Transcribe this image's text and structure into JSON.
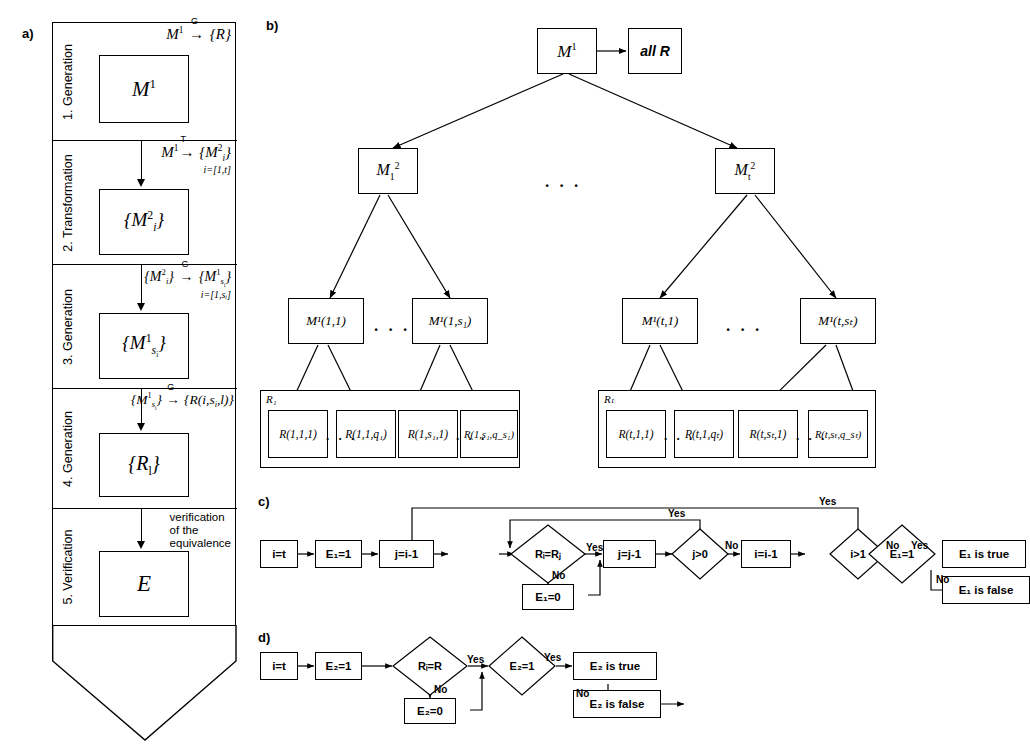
{
  "figure": {
    "panels": [
      {
        "id": "a",
        "label": "a)"
      },
      {
        "id": "b",
        "label": "b)"
      },
      {
        "id": "c",
        "label": "c)"
      },
      {
        "id": "d",
        "label": "d)"
      }
    ]
  },
  "panel_a": {
    "label": "a)",
    "stages": [
      {
        "index": "1. Generation",
        "formula_main": "M¹",
        "formula_arrow": "G",
        "formula_rhs": "{R}",
        "sub": "",
        "box": "M¹"
      },
      {
        "index": "2. Transformation",
        "formula_main": "M¹",
        "formula_arrow": "T",
        "formula_rhs": "{M²ᵢ}",
        "sub": "i=[1,t]",
        "box": "{M²ᵢ}"
      },
      {
        "index": "3. Generation",
        "formula_main": "{M²ᵢ}",
        "formula_arrow": "G",
        "formula_rhs": "{M¹ₛᵢ}",
        "sub": "i=[1,sᵢ]",
        "box": "{M¹ₛᵢ}"
      },
      {
        "index": "4. Generation",
        "formula_main": "{M¹ₛᵢ}",
        "formula_arrow": "G",
        "formula_rhs": "{R(i,sᵢ,l)}",
        "sub": "",
        "box": "{Rᵢ}"
      },
      {
        "index": "5. Verification",
        "formula_main": "",
        "formula_arrow": "",
        "formula_rhs": "",
        "sub": "",
        "box": "E",
        "note": "verification\nof the\nequivalence"
      }
    ],
    "note_lines": [
      "verification",
      "of the",
      "equivalence"
    ]
  },
  "panel_b": {
    "label": "b)",
    "root": "M¹",
    "all_r": "all R",
    "level2": [
      {
        "text_base": "M",
        "sub": "1",
        "sup": "2"
      },
      {
        "text_base": "M",
        "sub": "t",
        "sup": "2"
      }
    ],
    "level2_ellipsis": ". . .",
    "level3": [
      {
        "text": "M¹(1,1)"
      },
      {
        "text": "M¹(1,s₁)"
      },
      {
        "text": "M¹(t,1)"
      },
      {
        "text": "M¹(t,sₜ)"
      }
    ],
    "level3_ellipsis": ". . .",
    "groups": [
      {
        "label": "R₁",
        "boxes": [
          {
            "text": "R(1,1,1)"
          },
          {
            "text": "R(1,1,q₁)"
          },
          {
            "text": "R(1,s₁,1)"
          },
          {
            "text": "R(1,s₁,q_s₁)"
          }
        ],
        "ellipsis": ". . ."
      },
      {
        "label": "Rₜ",
        "boxes": [
          {
            "text": "R(t,1,1)"
          },
          {
            "text": "R(t,1,qₜ)"
          },
          {
            "text": "R(t,sₜ,1)"
          },
          {
            "text": "R(t,sₜ,q_sₜ)"
          }
        ],
        "ellipsis": ". . ."
      }
    ]
  },
  "panel_c": {
    "label": "c)",
    "nodes": [
      {
        "id": "start",
        "kind": "box",
        "text": "i=t"
      },
      {
        "id": "e1init",
        "kind": "box",
        "text": "E₁=1"
      },
      {
        "id": "jinit",
        "kind": "box",
        "text": "j=i-1"
      },
      {
        "id": "cmp",
        "kind": "diamond",
        "text": "Rᵢ=Rⱼ"
      },
      {
        "id": "e1zero",
        "kind": "box",
        "text": "E₁=0"
      },
      {
        "id": "jdec",
        "kind": "box",
        "text": "j=j-1"
      },
      {
        "id": "jgt0",
        "kind": "diamond",
        "text": "j>0"
      },
      {
        "id": "idec",
        "kind": "box",
        "text": "i=i-1"
      },
      {
        "id": "igt1",
        "kind": "diamond",
        "text": "i>1"
      },
      {
        "id": "e1chk",
        "kind": "diamond",
        "text": "E₁=1"
      },
      {
        "id": "true",
        "kind": "box",
        "text": "E₁ is true"
      },
      {
        "id": "false",
        "kind": "box",
        "text": "E₁ is false"
      }
    ],
    "edge_labels": {
      "cmp_yes": "Yes",
      "cmp_no": "No",
      "jgt0_yes": "Yes",
      "jgt0_no": "No",
      "igt1_yes": "Yes",
      "igt1_no": "No",
      "e1chk_yes": "Yes",
      "e1chk_no": "No"
    }
  },
  "panel_d": {
    "label": "d)",
    "nodes": [
      {
        "id": "start",
        "kind": "box",
        "text": "i=t"
      },
      {
        "id": "e2init",
        "kind": "box",
        "text": "E₂=1"
      },
      {
        "id": "cmp",
        "kind": "diamond",
        "text": "Rᵢ=R"
      },
      {
        "id": "e2zero",
        "kind": "box",
        "text": "E₂=0"
      },
      {
        "id": "e2chk",
        "kind": "diamond",
        "text": "E₂=1"
      },
      {
        "id": "true",
        "kind": "box",
        "text": "E₂ is true"
      },
      {
        "id": "false",
        "kind": "box",
        "text": "E₂ is false"
      }
    ],
    "edge_labels": {
      "cmp_yes": "Yes",
      "cmp_no": "No",
      "e2chk_yes": "Yes",
      "e2chk_no": "No"
    }
  },
  "colors": {
    "stroke": "#000000",
    "background": "#ffffff"
  }
}
